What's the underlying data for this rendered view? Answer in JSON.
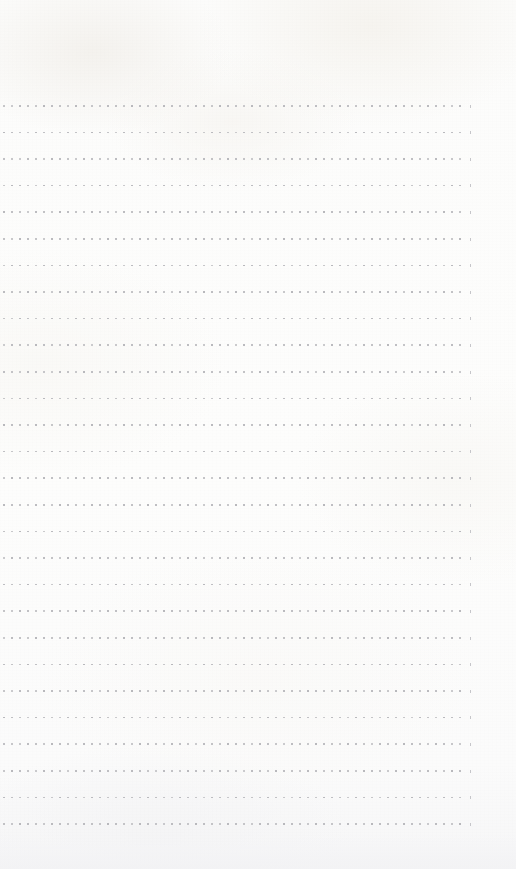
{
  "document": {
    "kind": "scanned-page",
    "description": "Blank scanned notepad page with dotted horizontal ruling",
    "page_width": 516,
    "page_height": 869,
    "paper_color": "#fdfdfc",
    "bottom_band_color": "#f2f2f4",
    "written_content": "",
    "text_lines": []
  },
  "ruling": {
    "style": "dotted",
    "line_count": 28,
    "first_line_y": 105,
    "line_spacing": 26.6,
    "dot_color": "#b9b9bd",
    "dot_size": 1.6,
    "dot_pitch": 8.0,
    "left_margin_x": 3,
    "right_end_x": 463,
    "end_tick_x": 470,
    "end_tick_color": "#c6c6ca"
  },
  "margins": {
    "top_blank_height": 105,
    "bottom_blank_height": 37
  }
}
